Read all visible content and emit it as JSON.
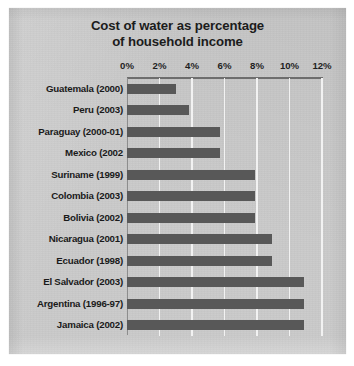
{
  "chart_data": {
    "type": "bar",
    "orientation": "horizontal",
    "title": "Cost of water as percentage of household income",
    "title_line1": "Cost of water as percentage",
    "title_line2": "of household income",
    "xlabel": "",
    "ylabel": "",
    "xlim": [
      0,
      12
    ],
    "xtick_labels": [
      "0%",
      "2%",
      "4%",
      "6%",
      "8%",
      "10%",
      "12%"
    ],
    "xtick_values": [
      0,
      2,
      4,
      6,
      8,
      10,
      12
    ],
    "grid": "vertical",
    "legend": "none",
    "bar_color": "#585858",
    "background_color": "#cacaca",
    "gridline_color": "#f2f2f2",
    "axis_color": "#6d6d6d",
    "categories": [
      "Guatemala (2000)",
      "Peru (2003)",
      "Paraguay (2000-01)",
      "Mexico (2002",
      "Suriname (1999)",
      "Colombia (2003)",
      "Bolivia (2002)",
      "Nicaragua (2001)",
      "Ecuador (1998)",
      "El Salvador (2003)",
      "Argentina (1996-97)",
      "Jamaica (2002)"
    ],
    "values": [
      3.0,
      3.8,
      5.7,
      5.7,
      7.9,
      7.9,
      7.9,
      8.9,
      8.9,
      10.9,
      10.9,
      10.9
    ]
  }
}
